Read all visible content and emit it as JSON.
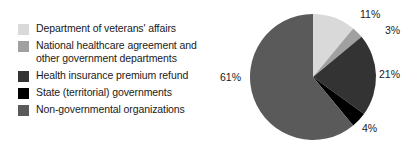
{
  "chart_data": {
    "type": "pie",
    "title": "",
    "labels": [
      "Department of veterans' affairs",
      "National healthcare agreement and other government departments",
      "Health insurance premium refund",
      "State (territorial) governments",
      "Non-governmental organizations"
    ],
    "values": [
      11,
      3,
      21,
      4,
      61
    ],
    "value_labels": [
      "11%",
      "3%",
      "21%",
      "4%",
      "61%"
    ],
    "colors": [
      "#d9d9d9",
      "#a0a0a0",
      "#333333",
      "#000000",
      "#5a5a5a"
    ],
    "start_angle": 0,
    "direction": "clockwise",
    "legend_position": "left",
    "grid": false
  },
  "legend": {
    "items": [
      {
        "label": "Department of veterans' affairs",
        "color": "#d9d9d9"
      },
      {
        "label": "National healthcare agreement and\nother government departments",
        "color": "#a0a0a0"
      },
      {
        "label": "Health insurance premium refund",
        "color": "#333333"
      },
      {
        "label": "State (territorial) governments",
        "color": "#000000"
      },
      {
        "label": "Non-governmental organizations",
        "color": "#5a5a5a"
      }
    ]
  },
  "pie": {
    "labels": [
      {
        "text": "11%",
        "left": 150,
        "top": 8
      },
      {
        "text": "3%",
        "left": 175,
        "top": 24
      },
      {
        "text": "21%",
        "left": 169,
        "top": 68
      },
      {
        "text": "4%",
        "left": 152,
        "top": 122
      },
      {
        "text": "61%",
        "left": 10,
        "top": 71
      }
    ]
  }
}
